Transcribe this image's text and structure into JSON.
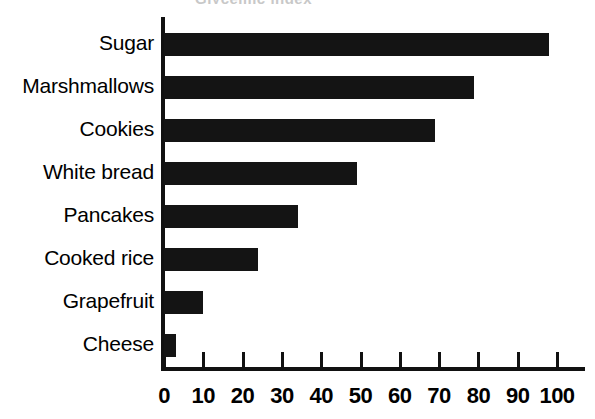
{
  "title_remnant": "Glycemic index",
  "chart_data": {
    "type": "bar",
    "orientation": "horizontal",
    "title": "",
    "xlabel": "",
    "ylabel": "",
    "categories": [
      "Sugar",
      "Marshmallows",
      "Cookies",
      "White bread",
      "Pancakes",
      "Cooked rice",
      "Grapefruit",
      "Cheese"
    ],
    "values": [
      98,
      79,
      69,
      49,
      34,
      24,
      10,
      3
    ],
    "xlim": [
      0,
      100
    ],
    "xticks": [
      0,
      10,
      20,
      30,
      40,
      50,
      60,
      70,
      80,
      90,
      100
    ],
    "xtick_labels": [
      "0",
      "10",
      "20",
      "30",
      "40",
      "50",
      "60",
      "70",
      "80",
      "90",
      "100"
    ],
    "grid": false,
    "legend": null,
    "bar_color": "#141414",
    "background_color": "#ffffff",
    "axis_color": "#111111"
  }
}
